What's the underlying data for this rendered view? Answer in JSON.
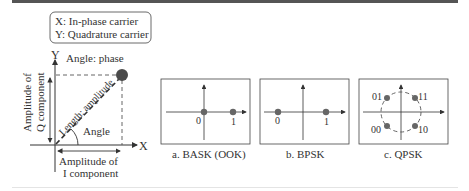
{
  "legend_box": {
    "line1": "X: In-phase carrier",
    "line2": "Y: Quadrature carrier"
  },
  "main_diagram": {
    "y_axis_label": "Y",
    "x_axis_label": "X",
    "angle_phase_label": "Angle: phase",
    "length_label": "Length: amplitude",
    "angle_label": "Angle",
    "q_amplitude_line1": "Amplitude of",
    "q_amplitude_line2": "Q component",
    "i_amplitude_line1": "Amplitude of",
    "i_amplitude_line2": "I component"
  },
  "panels": [
    {
      "caption": "a. BASK (OOK)",
      "points": [
        {
          "label": "0"
        },
        {
          "label": "1"
        }
      ]
    },
    {
      "caption": "b. BPSK",
      "points": [
        {
          "label": "0"
        },
        {
          "label": "1"
        }
      ]
    },
    {
      "caption": "c. QPSK",
      "points": [
        {
          "label": "01"
        },
        {
          "label": "11"
        },
        {
          "label": "00"
        },
        {
          "label": "10"
        }
      ]
    }
  ],
  "colors": {
    "point": "#666666",
    "big_point": "#4a4a4a",
    "line": "#333333"
  }
}
